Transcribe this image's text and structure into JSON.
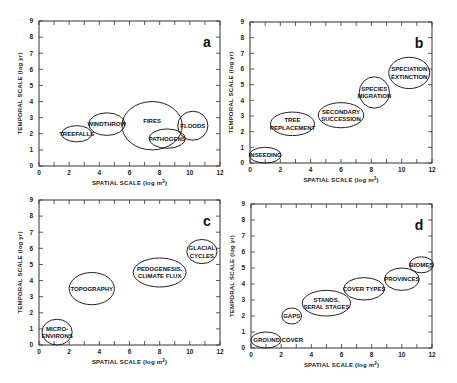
{
  "chart_data": [
    {
      "type": "scatter",
      "panel": "a",
      "xlabel": "SPATIAL SCALE (log m²)",
      "ylabel": "TEMPORAL SCALE (log yr)",
      "xlim": [
        0,
        12
      ],
      "ylim": [
        0,
        9
      ],
      "xticks": [
        0,
        2,
        4,
        6,
        8,
        10,
        12
      ],
      "yticks": [
        0,
        1,
        2,
        3,
        4,
        5,
        6,
        7,
        8,
        9
      ],
      "ellipses": [
        {
          "label": [
            "TREEFALLS"
          ],
          "cx": 2.5,
          "cy": 2.0,
          "rx": 1.0,
          "ry": 0.5
        },
        {
          "label": [
            "WINDTHROW"
          ],
          "cx": 4.5,
          "cy": 2.6,
          "rx": 1.2,
          "ry": 0.7
        },
        {
          "label": [
            "FIRES"
          ],
          "cx": 7.5,
          "cy": 2.5,
          "rx": 2.0,
          "ry": 1.5,
          "lx": 7.5,
          "ly": 2.8
        },
        {
          "label": [
            "PATHOGENS"
          ],
          "cx": 8.5,
          "cy": 1.7,
          "rx": 1.2,
          "ry": 0.6
        },
        {
          "label": [
            "FLOODS"
          ],
          "cx": 10.2,
          "cy": 2.5,
          "rx": 1.0,
          "ry": 0.9
        }
      ]
    },
    {
      "type": "scatter",
      "panel": "b",
      "xlabel": "SPATIAL SCALE (log m²)",
      "ylabel": "TEMPORAL SCALE (log yr)",
      "xlim": [
        0,
        12
      ],
      "ylim": [
        0,
        9
      ],
      "xticks": [
        0,
        2,
        4,
        6,
        8,
        10,
        12
      ],
      "yticks": [
        0,
        1,
        2,
        3,
        4,
        5,
        6,
        7,
        8,
        9
      ],
      "ellipses": [
        {
          "label": [
            "INSEEDING"
          ],
          "cx": 1.0,
          "cy": 0.5,
          "rx": 1.05,
          "ry": 0.5
        },
        {
          "label": [
            "TREE",
            "REPLACEMENT"
          ],
          "cx": 2.8,
          "cy": 2.5,
          "rx": 1.45,
          "ry": 0.75
        },
        {
          "label": [
            "SECONDARY",
            "SUCCESSION"
          ],
          "cx": 6.0,
          "cy": 3.05,
          "rx": 1.5,
          "ry": 0.8
        },
        {
          "label": [
            "SPECIES",
            "MIGRATION"
          ],
          "cx": 8.2,
          "cy": 4.5,
          "rx": 1.0,
          "ry": 1.0
        },
        {
          "label": [
            "SPECIATION",
            "EXTINCTION"
          ],
          "cx": 10.5,
          "cy": 5.75,
          "rx": 1.35,
          "ry": 1.0
        }
      ]
    },
    {
      "type": "scatter",
      "panel": "c",
      "xlabel": "SPATIAL SCALE (log m²)",
      "ylabel": "TEMPORAL SCALE (log yr)",
      "xlim": [
        0,
        12
      ],
      "ylim": [
        0,
        9
      ],
      "xticks": [
        0,
        2,
        4,
        6,
        8,
        10,
        12
      ],
      "yticks": [
        0,
        1,
        2,
        3,
        4,
        5,
        6,
        7,
        8,
        9
      ],
      "ellipses": [
        {
          "label": [
            "MICRO-",
            "ENVIRONS"
          ],
          "cx": 1.2,
          "cy": 0.8,
          "rx": 1.0,
          "ry": 0.8
        },
        {
          "label": [
            "TOPOGRAPHY"
          ],
          "cx": 3.5,
          "cy": 3.5,
          "rx": 1.5,
          "ry": 1.0
        },
        {
          "label": [
            "PEDOGENESIS,",
            "CLIMATE FLUX"
          ],
          "cx": 8.0,
          "cy": 4.5,
          "rx": 1.75,
          "ry": 0.9
        },
        {
          "label": [
            "GLACIAL",
            "CYCLES"
          ],
          "cx": 10.8,
          "cy": 5.8,
          "rx": 1.0,
          "ry": 0.75
        }
      ]
    },
    {
      "type": "scatter",
      "panel": "d",
      "xlabel": "SPATIAL  SCALE (log m²)",
      "ylabel": "TEMPORAL SCALE (log yr)",
      "xlim": [
        0,
        12
      ],
      "ylim": [
        0,
        9
      ],
      "xticks": [
        0,
        2,
        4,
        6,
        8,
        10,
        12
      ],
      "yticks": [
        0,
        1,
        2,
        3,
        4,
        5,
        6,
        7,
        8,
        9
      ],
      "ellipses": [
        {
          "label": [
            "GROUND  COVER"
          ],
          "cx": 1.0,
          "cy": 0.5,
          "rx": 1.0,
          "ry": 0.5,
          "lx": 1.8,
          "ly": 0.5
        },
        {
          "label": [
            "GAPS"
          ],
          "cx": 2.7,
          "cy": 2.0,
          "rx": 0.65,
          "ry": 0.5
        },
        {
          "label": [
            "STANDS,",
            "SERAL STAGES"
          ],
          "cx": 5.0,
          "cy": 2.8,
          "rx": 1.6,
          "ry": 0.8
        },
        {
          "label": [
            "COVER TYPES"
          ],
          "cx": 7.5,
          "cy": 3.7,
          "rx": 1.35,
          "ry": 0.7
        },
        {
          "label": [
            "PROVINCES"
          ],
          "cx": 10.0,
          "cy": 4.3,
          "rx": 1.15,
          "ry": 0.7
        },
        {
          "label": [
            "BIOMES"
          ],
          "cx": 11.3,
          "cy": 5.2,
          "rx": 0.8,
          "ry": 0.5
        }
      ]
    }
  ],
  "panels": [
    {
      "letter": "a",
      "xlabel": "SPATIAL SCALE (log m²)",
      "ylabel": "TEMPORAL SCALE (log yr)"
    },
    {
      "letter": "b",
      "xlabel": "SPATIAL SCALE (log m²)",
      "ylabel": "TEMPORAL SCALE (log yr)"
    },
    {
      "letter": "c",
      "xlabel": "SPATIAL SCALE (log m²)",
      "ylabel": "TEMPORAL SCALE (log yr)"
    },
    {
      "letter": "d",
      "xlabel": "SPATIAL  SCALE (log m²)",
      "ylabel": "TEMPORAL SCALE (log yr)"
    }
  ]
}
